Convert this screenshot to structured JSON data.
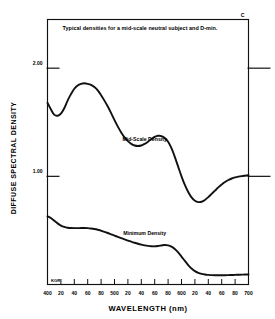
{
  "chart_data": {
    "type": "line",
    "title": "Typical densities for a mid-scale neutral subject and D-min.",
    "corner_label": "C",
    "xlabel": "WAVELENGTH (nm)",
    "ylabel": "DIFFUSE SPECTRAL DENSITY",
    "xlim": [
      400,
      700
    ],
    "ylim": [
      0.0,
      2.45
    ],
    "grid": false,
    "legend_position": "inline-annotations",
    "stamp": "KGR",
    "x_tick_values": [
      400,
      420,
      440,
      460,
      480,
      500,
      520,
      540,
      560,
      580,
      600,
      620,
      640,
      660,
      680,
      700
    ],
    "x_tick_labels": [
      "400",
      "20",
      "40",
      "60",
      "80",
      "500",
      "20",
      "40",
      "60",
      "80",
      "600",
      "20",
      "40",
      "60",
      "80",
      "700"
    ],
    "y_tick_values": [
      2.0,
      1.0
    ],
    "y_tick_labels": [
      "2.00",
      "1.00"
    ],
    "series": [
      {
        "name": "Mid-Scale Density",
        "label_x": 545,
        "label_y": 1.33,
        "x": [
          400,
          405,
          410,
          415,
          420,
          425,
          430,
          435,
          440,
          445,
          450,
          455,
          460,
          465,
          470,
          475,
          480,
          485,
          490,
          495,
          500,
          505,
          510,
          515,
          520,
          525,
          530,
          535,
          540,
          545,
          550,
          555,
          560,
          565,
          570,
          575,
          580,
          585,
          590,
          595,
          600,
          605,
          610,
          615,
          620,
          625,
          630,
          635,
          640,
          645,
          650,
          655,
          660,
          665,
          670,
          675,
          680,
          685,
          690,
          695,
          700
        ],
        "values": [
          1.68,
          1.62,
          1.57,
          1.56,
          1.58,
          1.63,
          1.7,
          1.76,
          1.81,
          1.84,
          1.855,
          1.86,
          1.855,
          1.845,
          1.825,
          1.795,
          1.75,
          1.7,
          1.645,
          1.585,
          1.52,
          1.46,
          1.405,
          1.36,
          1.325,
          1.3,
          1.285,
          1.28,
          1.285,
          1.3,
          1.32,
          1.345,
          1.365,
          1.375,
          1.372,
          1.355,
          1.32,
          1.26,
          1.18,
          1.09,
          1.0,
          0.92,
          0.855,
          0.805,
          0.775,
          0.762,
          0.765,
          0.782,
          0.808,
          0.838,
          0.868,
          0.898,
          0.925,
          0.948,
          0.966,
          0.98,
          0.99,
          0.997,
          1.002,
          1.006,
          1.01
        ]
      },
      {
        "name": "Minimum Density",
        "label_x": 545,
        "label_y": 0.46,
        "x": [
          400,
          405,
          410,
          415,
          420,
          425,
          430,
          435,
          440,
          445,
          450,
          455,
          460,
          465,
          470,
          475,
          480,
          485,
          490,
          495,
          500,
          505,
          510,
          515,
          520,
          525,
          530,
          535,
          540,
          545,
          550,
          555,
          560,
          565,
          570,
          575,
          580,
          585,
          590,
          595,
          600,
          605,
          610,
          615,
          620,
          625,
          630,
          635,
          640,
          645,
          650,
          655,
          660,
          665,
          670,
          675,
          680,
          685,
          690,
          695,
          700
        ],
        "values": [
          0.63,
          0.615,
          0.59,
          0.565,
          0.545,
          0.532,
          0.525,
          0.522,
          0.521,
          0.521,
          0.522,
          0.522,
          0.521,
          0.518,
          0.513,
          0.506,
          0.497,
          0.487,
          0.476,
          0.464,
          0.452,
          0.44,
          0.428,
          0.417,
          0.406,
          0.396,
          0.386,
          0.377,
          0.369,
          0.362,
          0.357,
          0.354,
          0.353,
          0.356,
          0.361,
          0.365,
          0.362,
          0.35,
          0.328,
          0.296,
          0.258,
          0.218,
          0.18,
          0.148,
          0.124,
          0.108,
          0.098,
          0.092,
          0.089,
          0.087,
          0.086,
          0.086,
          0.086,
          0.086,
          0.087,
          0.088,
          0.089,
          0.09,
          0.091,
          0.092,
          0.093
        ]
      }
    ]
  }
}
